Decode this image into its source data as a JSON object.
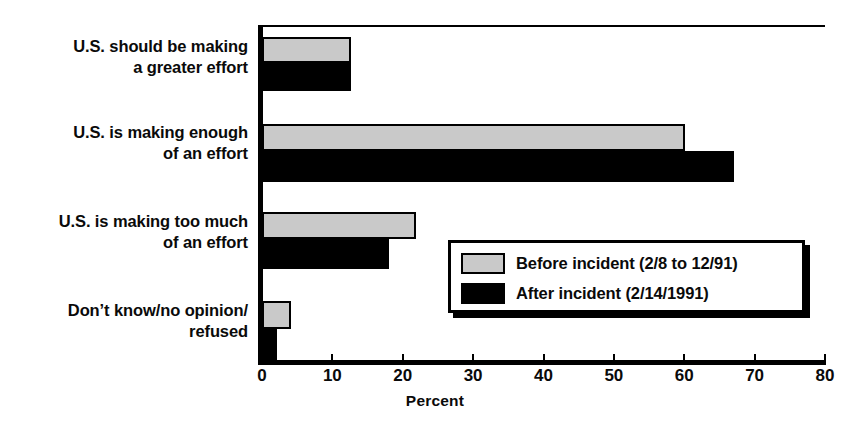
{
  "chart_data": {
    "type": "bar",
    "orientation": "horizontal",
    "title": "",
    "xlabel": "Percent",
    "ylabel": "",
    "xlim": [
      0,
      80
    ],
    "xticks": [
      0,
      10,
      20,
      30,
      40,
      50,
      60,
      70,
      80
    ],
    "grid": false,
    "legend_position": "inside-lower-right",
    "categories": [
      "U.S. should be making\na greater effort",
      "U.S. is making enough\nof an effort",
      "U.S. is making too much\nof an effort",
      "Don’t know/no opinion/\nrefused"
    ],
    "series": [
      {
        "name": "Before incident (2/8 to 12/91)",
        "color": "#c9c9c9",
        "values": [
          12.4,
          59.8,
          21.6,
          3.8
        ]
      },
      {
        "name": "After incident (2/14/1991)",
        "color": "#000000",
        "values": [
          12.4,
          66.8,
          17.8,
          1.8
        ]
      }
    ]
  },
  "legend": {
    "items": [
      {
        "label": "Before incident (2/8 to 12/91)",
        "swatch": "before"
      },
      {
        "label": "After incident (2/14/1991)",
        "swatch": "after"
      }
    ]
  },
  "axis": {
    "tick_labels": [
      "0",
      "10",
      "20",
      "30",
      "40",
      "50",
      "60",
      "70",
      "80"
    ],
    "title": "Percent"
  }
}
